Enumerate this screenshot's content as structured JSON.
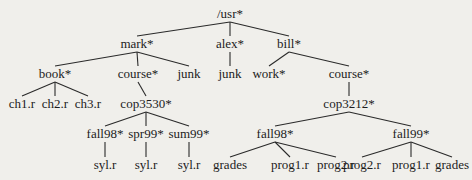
{
  "diagram": {
    "type": "directory-tree",
    "nodes": [
      {
        "id": "usr",
        "label": "/usr*",
        "x": 230,
        "y": 18,
        "parent": null
      },
      {
        "id": "mark",
        "label": "mark*",
        "x": 137,
        "y": 48,
        "parent": "usr"
      },
      {
        "id": "alex",
        "label": "alex*",
        "x": 230,
        "y": 48,
        "parent": "usr"
      },
      {
        "id": "bill",
        "label": "bill*",
        "x": 289,
        "y": 48,
        "parent": "usr"
      },
      {
        "id": "book",
        "label": "book*",
        "x": 55,
        "y": 78,
        "parent": "mark"
      },
      {
        "id": "mark_course",
        "label": "course*",
        "x": 138,
        "y": 78,
        "parent": "mark"
      },
      {
        "id": "mark_junk",
        "label": "junk",
        "x": 189,
        "y": 78,
        "parent": "mark"
      },
      {
        "id": "alex_junk",
        "label": "junk",
        "x": 230,
        "y": 78,
        "parent": "alex"
      },
      {
        "id": "work",
        "label": "work*",
        "x": 269,
        "y": 78,
        "parent": "bill"
      },
      {
        "id": "bill_course",
        "label": "course*",
        "x": 349,
        "y": 78,
        "parent": "bill"
      },
      {
        "id": "ch1",
        "label": "ch1.r",
        "x": 22,
        "y": 108,
        "parent": "book"
      },
      {
        "id": "ch2",
        "label": "ch2.r",
        "x": 55,
        "y": 108,
        "parent": "book"
      },
      {
        "id": "ch3",
        "label": "ch3.r",
        "x": 88,
        "y": 108,
        "parent": "book"
      },
      {
        "id": "cop3530",
        "label": "cop3530*",
        "x": 146,
        "y": 108,
        "parent": "mark_course"
      },
      {
        "id": "cop3212",
        "label": "cop3212*",
        "x": 349,
        "y": 108,
        "parent": "bill_course"
      },
      {
        "id": "fall98a",
        "label": "fall98*",
        "x": 105,
        "y": 138,
        "parent": "cop3530"
      },
      {
        "id": "spr99",
        "label": "spr99*",
        "x": 146,
        "y": 138,
        "parent": "cop3530"
      },
      {
        "id": "sum99",
        "label": "sum99*",
        "x": 189,
        "y": 138,
        "parent": "cop3530"
      },
      {
        "id": "fall98b",
        "label": "fall98*",
        "x": 275,
        "y": 138,
        "parent": "cop3212"
      },
      {
        "id": "fall99",
        "label": "fall99*",
        "x": 411,
        "y": 138,
        "parent": "cop3212"
      },
      {
        "id": "syl1",
        "label": "syl.r",
        "x": 105,
        "y": 169,
        "parent": "fall98a"
      },
      {
        "id": "syl2",
        "label": "syl.r",
        "x": 146,
        "y": 169,
        "parent": "spr99"
      },
      {
        "id": "syl3",
        "label": "syl.r",
        "x": 189,
        "y": 169,
        "parent": "sum99"
      },
      {
        "id": "grades1",
        "label": "grades",
        "x": 230,
        "y": 169,
        "parent": "fall98b"
      },
      {
        "id": "prog1a",
        "label": "prog1.r",
        "x": 290,
        "y": 169,
        "parent": "fall98b"
      },
      {
        "id": "prog2a",
        "label": "prog2.r",
        "x": 336,
        "y": 169,
        "parent": "fall98b"
      },
      {
        "id": "prog2b",
        "label": "prog2.r",
        "x": 362,
        "y": 169,
        "parent": "fall99"
      },
      {
        "id": "prog1b",
        "label": "prog1.r",
        "x": 411,
        "y": 169,
        "parent": "fall99"
      },
      {
        "id": "grades2",
        "label": "grades",
        "x": 452,
        "y": 169,
        "parent": "fall99"
      }
    ]
  },
  "colors": {
    "background": "#f0efeb",
    "ink": "#1c1c1c"
  }
}
